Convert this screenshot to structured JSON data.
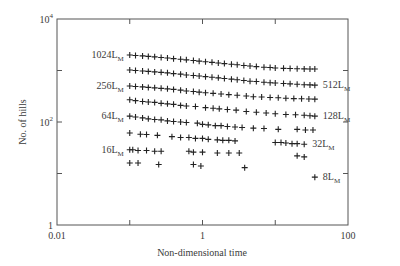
{
  "chart_data": {
    "type": "scatter",
    "title": "",
    "xlabel": "Non-dimensional time",
    "ylabel": "No. of hills",
    "xscale": "log",
    "yscale": "log",
    "xlim": [
      0.01,
      100
    ],
    "ylim": [
      1,
      10000
    ],
    "x_ticks": [
      {
        "value": 0.01,
        "label": "0.01"
      },
      {
        "value": 0.1,
        "label": ""
      },
      {
        "value": 1,
        "label": "1"
      },
      {
        "value": 10,
        "label": ""
      },
      {
        "value": 100,
        "label": "100"
      }
    ],
    "y_ticks": [
      {
        "value": 1,
        "label": "1",
        "exp": ""
      },
      {
        "value": 10,
        "label": "",
        "exp": ""
      },
      {
        "value": 100,
        "label": "10",
        "exp": "2"
      },
      {
        "value": 1000,
        "label": "",
        "exp": ""
      },
      {
        "value": 10000,
        "label": "10",
        "exp": "4"
      }
    ],
    "grid": false,
    "marker": "+",
    "series": [
      {
        "name": "1024L_M",
        "label": "1024L",
        "sub": "M",
        "label_side": "left",
        "x": [
          0.1,
          0.12,
          0.15,
          0.18,
          0.22,
          0.27,
          0.33,
          0.4,
          0.5,
          0.6,
          0.75,
          0.9,
          1.1,
          1.35,
          1.65,
          2,
          2.5,
          3,
          3.7,
          4.5,
          5.5,
          7,
          8.5,
          10,
          13,
          16,
          20,
          25,
          30,
          35
        ],
        "y": [
          2000,
          1960,
          1920,
          1880,
          1840,
          1790,
          1750,
          1700,
          1650,
          1610,
          1560,
          1520,
          1480,
          1440,
          1400,
          1360,
          1320,
          1290,
          1250,
          1220,
          1190,
          1160,
          1140,
          1120,
          1100,
          1090,
          1080,
          1075,
          1070,
          1070
        ]
      },
      {
        "name": "512L_M",
        "label": "512L",
        "sub": "M",
        "label_side": "right",
        "x": [
          0.1,
          0.12,
          0.15,
          0.18,
          0.22,
          0.27,
          0.33,
          0.4,
          0.5,
          0.6,
          0.75,
          0.9,
          1.1,
          1.35,
          1.65,
          2,
          2.5,
          3,
          3.7,
          4.5,
          5.5,
          7,
          8.5,
          10,
          13,
          16,
          20,
          25,
          30,
          35
        ],
        "y": [
          1020,
          1000,
          980,
          960,
          940,
          920,
          900,
          870,
          850,
          820,
          800,
          780,
          760,
          740,
          720,
          700,
          680,
          660,
          640,
          620,
          610,
          590,
          580,
          570,
          560,
          550,
          540,
          530,
          525,
          520
        ]
      },
      {
        "name": "256L_M",
        "label": "256L",
        "sub": "M",
        "label_side": "left",
        "x": [
          0.1,
          0.12,
          0.15,
          0.18,
          0.22,
          0.27,
          0.33,
          0.4,
          0.5,
          0.6,
          0.75,
          0.9,
          1.1,
          1.4,
          1.8,
          2.3,
          3,
          4,
          5,
          6.5,
          8.5,
          11,
          14,
          18,
          23,
          29,
          35
        ],
        "y": [
          500,
          490,
          480,
          470,
          460,
          450,
          440,
          430,
          415,
          400,
          390,
          380,
          370,
          360,
          350,
          340,
          330,
          320,
          310,
          305,
          300,
          295,
          290,
          285,
          282,
          280,
          278
        ]
      },
      {
        "name": "128L_M",
        "label": "128L",
        "sub": "M",
        "label_side": "right",
        "x": [
          0.1,
          0.12,
          0.15,
          0.18,
          0.22,
          0.27,
          0.33,
          0.4,
          0.5,
          0.6,
          0.8,
          1.1,
          1.4,
          1.7,
          2.2,
          2.9,
          4,
          5.5,
          7.5,
          10,
          14,
          19,
          25,
          30,
          35
        ],
        "y": [
          270,
          260,
          250,
          245,
          240,
          230,
          225,
          220,
          210,
          205,
          200,
          190,
          185,
          180,
          175,
          170,
          160,
          155,
          150,
          145,
          140,
          138,
          135,
          132,
          130
        ]
      },
      {
        "name": "64L_M",
        "label": "64L",
        "sub": "M",
        "label_side": "left",
        "x": [
          0.1,
          0.12,
          0.15,
          0.18,
          0.22,
          0.27,
          0.33,
          0.4,
          0.5,
          0.6,
          0.85,
          1,
          1.2,
          1.5,
          1.8,
          2.2,
          2.8,
          3.5,
          5,
          7,
          11,
          20,
          26,
          33
        ],
        "y": [
          130,
          125,
          120,
          115,
          112,
          110,
          105,
          102,
          100,
          98,
          95,
          90,
          88,
          85,
          85,
          82,
          80,
          78,
          76,
          75,
          72,
          72,
          70,
          70
        ]
      },
      {
        "name": "32L_M",
        "label": "32L",
        "sub": "M",
        "label_side": "right",
        "x": [
          0.1,
          0.14,
          0.17,
          0.24,
          0.38,
          0.5,
          0.65,
          0.8,
          1,
          1.2,
          1.6,
          1.9,
          2.3,
          2.8,
          10,
          12,
          14,
          17,
          20,
          25
        ],
        "y": [
          61,
          58,
          57,
          55,
          52,
          50,
          50,
          48,
          48,
          46,
          45,
          44,
          44,
          43,
          40,
          40,
          39,
          38,
          38,
          37
        ]
      },
      {
        "name": "16L_M",
        "label": "16L",
        "sub": "M",
        "label_side": "left",
        "x": [
          0.1,
          0.11,
          0.13,
          0.17,
          0.22,
          0.27,
          0.65,
          0.75,
          1,
          1.6,
          2.3,
          3.2,
          20,
          25
        ],
        "y": [
          29,
          29,
          28,
          28,
          27,
          27,
          27,
          26,
          26,
          25,
          25,
          25,
          22,
          21
        ]
      },
      {
        "name": "8L_M",
        "label": "8L",
        "sub": "M",
        "label_side": "right",
        "x": [
          0.1,
          0.13,
          0.25,
          0.75,
          0.95,
          3.8,
          35
        ],
        "y": [
          16,
          16,
          15,
          15,
          14,
          13,
          8.5
        ]
      }
    ]
  }
}
